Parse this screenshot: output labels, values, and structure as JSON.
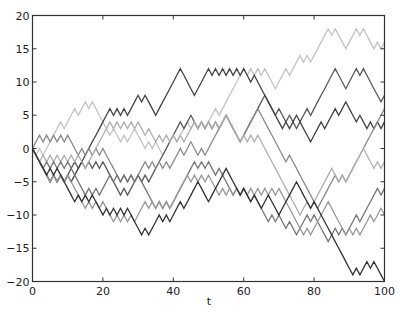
{
  "chart_data": {
    "type": "line",
    "title": "",
    "xlabel": "t",
    "ylabel": "",
    "xlim": [
      0,
      100
    ],
    "ylim": [
      -20,
      20
    ],
    "grid": false,
    "legend": null,
    "x_ticks": [
      0,
      20,
      40,
      60,
      80,
      100
    ],
    "y_ticks": [
      -20,
      -15,
      -10,
      -5,
      0,
      5,
      10,
      15,
      20
    ],
    "x_tick_labels": [
      "0",
      "20",
      "40",
      "60",
      "80",
      "100"
    ],
    "y_tick_labels": [
      "−20",
      "−15",
      "−10",
      "−5",
      "0",
      "5",
      "10",
      "15",
      "20"
    ],
    "series": [
      {
        "name": "walk-1",
        "color": "#c4c4c4",
        "waypoints": [
          [
            0,
            0
          ],
          [
            5,
            1
          ],
          [
            10,
            4
          ],
          [
            15,
            7
          ],
          [
            19,
            5
          ],
          [
            25,
            1
          ],
          [
            29,
            3
          ],
          [
            37,
            -1
          ],
          [
            43,
            3
          ],
          [
            50,
            4
          ],
          [
            55,
            7
          ],
          [
            58,
            10
          ],
          [
            60,
            12
          ],
          [
            66,
            12
          ],
          [
            70,
            10
          ],
          [
            75,
            12
          ],
          [
            80,
            14
          ],
          [
            86,
            18
          ],
          [
            90,
            16
          ],
          [
            94,
            18
          ],
          [
            100,
            16
          ]
        ]
      },
      {
        "name": "walk-2",
        "color": "#5a5a5a",
        "waypoints": [
          [
            0,
            0
          ],
          [
            10,
            -4
          ],
          [
            20,
            -2
          ],
          [
            28,
            -6
          ],
          [
            35,
            -3
          ],
          [
            45,
            5
          ],
          [
            50,
            4
          ],
          [
            55,
            5
          ],
          [
            60,
            2
          ],
          [
            66,
            8
          ],
          [
            70,
            6
          ],
          [
            75,
            3
          ],
          [
            80,
            6
          ],
          [
            86,
            12
          ],
          [
            90,
            10
          ],
          [
            94,
            12
          ],
          [
            100,
            8
          ]
        ]
      },
      {
        "name": "walk-3",
        "color": "#444444",
        "waypoints": [
          [
            0,
            0
          ],
          [
            12,
            -4
          ],
          [
            20,
            4
          ],
          [
            24,
            6
          ],
          [
            28,
            6
          ],
          [
            32,
            8
          ],
          [
            36,
            6
          ],
          [
            42,
            12
          ],
          [
            46,
            8
          ],
          [
            50,
            12
          ],
          [
            60,
            12
          ],
          [
            65,
            9
          ],
          [
            70,
            5
          ],
          [
            75,
            4
          ],
          [
            80,
            2
          ],
          [
            85,
            5
          ],
          [
            90,
            7
          ],
          [
            95,
            3
          ],
          [
            100,
            4
          ]
        ]
      },
      {
        "name": "walk-4",
        "color": "#8a8a8a",
        "waypoints": [
          [
            0,
            0
          ],
          [
            10,
            2
          ],
          [
            20,
            0
          ],
          [
            30,
            -4
          ],
          [
            40,
            -2
          ],
          [
            45,
            1
          ],
          [
            50,
            0
          ],
          [
            55,
            5
          ],
          [
            60,
            2
          ],
          [
            64,
            6
          ],
          [
            70,
            0
          ],
          [
            75,
            -3
          ],
          [
            81,
            -9
          ],
          [
            85,
            -5
          ],
          [
            90,
            -4
          ],
          [
            95,
            1
          ],
          [
            100,
            6
          ]
        ]
      },
      {
        "name": "walk-5",
        "color": "#b0b0b0",
        "waypoints": [
          [
            0,
            0
          ],
          [
            15,
            -3
          ],
          [
            20,
            2
          ],
          [
            30,
            4
          ],
          [
            35,
            1
          ],
          [
            45,
            3
          ],
          [
            55,
            5
          ],
          [
            60,
            2
          ],
          [
            64,
            2
          ],
          [
            70,
            -4
          ],
          [
            76,
            -10
          ],
          [
            80,
            -8
          ],
          [
            85,
            -3
          ],
          [
            90,
            -4
          ],
          [
            94,
            0
          ],
          [
            100,
            -2
          ]
        ]
      },
      {
        "name": "walk-6",
        "color": "#777777",
        "waypoints": [
          [
            0,
            0
          ],
          [
            10,
            -2
          ],
          [
            20,
            -6
          ],
          [
            30,
            -4
          ],
          [
            40,
            -8
          ],
          [
            50,
            -2
          ],
          [
            55,
            -5
          ],
          [
            60,
            -6
          ],
          [
            65,
            -9
          ],
          [
            70,
            -10
          ],
          [
            75,
            -13
          ],
          [
            80,
            -10
          ],
          [
            85,
            -14
          ],
          [
            90,
            -12
          ],
          [
            95,
            -9
          ],
          [
            100,
            -6
          ]
        ]
      },
      {
        "name": "walk-7",
        "color": "#999999",
        "waypoints": [
          [
            0,
            0
          ],
          [
            10,
            -4
          ],
          [
            20,
            -8
          ],
          [
            30,
            -10
          ],
          [
            40,
            -8
          ],
          [
            50,
            -4
          ],
          [
            60,
            -6
          ],
          [
            70,
            -6
          ],
          [
            80,
            -12
          ],
          [
            84,
            -8
          ],
          [
            90,
            -12
          ],
          [
            95,
            -11
          ],
          [
            100,
            -9
          ]
        ]
      },
      {
        "name": "walk-8",
        "color": "#333333",
        "waypoints": [
          [
            0,
            0
          ],
          [
            10,
            -5
          ],
          [
            20,
            -9
          ],
          [
            30,
            -11
          ],
          [
            35,
            -12
          ],
          [
            40,
            -10
          ],
          [
            45,
            -7
          ],
          [
            50,
            -7
          ],
          [
            55,
            -4
          ],
          [
            60,
            -6
          ],
          [
            65,
            -9
          ],
          [
            70,
            -9
          ],
          [
            75,
            -6
          ],
          [
            80,
            -8
          ],
          [
            85,
            -13
          ],
          [
            90,
            -17
          ],
          [
            95,
            -17
          ],
          [
            100,
            -19
          ]
        ]
      }
    ]
  },
  "axes": {
    "xlabel": "t"
  }
}
